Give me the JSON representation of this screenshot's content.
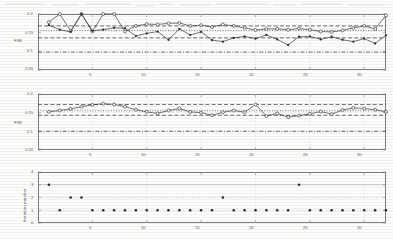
{
  "figure": {
    "title": "",
    "background": "#fdfdfc",
    "ink_color": "#4a4a4a"
  },
  "panels": [
    {
      "name": "panel-1",
      "ylabel": "F/M",
      "yticks": [
        "0.2",
        "0.15",
        "0.1",
        "0.05"
      ],
      "ytick_values": [
        0.2,
        0.15,
        0.1,
        0.05
      ],
      "xticks": [
        "5",
        "10",
        "15",
        "20",
        "25",
        "30"
      ],
      "xtick_values": [
        5,
        10,
        15,
        20,
        25,
        30
      ]
    },
    {
      "name": "panel-2",
      "ylabel": "F/M",
      "yticks": [
        "0.2",
        "0.15",
        "0.1",
        "0.05"
      ],
      "ytick_values": [
        0.2,
        0.15,
        0.1,
        0.05
      ],
      "xticks": [
        "5",
        "10",
        "15",
        "20",
        "25",
        "30"
      ],
      "xtick_values": [
        5,
        10,
        15,
        20,
        25,
        30
      ]
    },
    {
      "name": "panel-3",
      "ylabel": "Iteration number",
      "yticks": [
        "0",
        "1",
        "2",
        "3",
        "4"
      ],
      "ytick_values": [
        0,
        1,
        2,
        3,
        4
      ],
      "xticks": [
        "5",
        "10",
        "15",
        "20",
        "25",
        "30"
      ],
      "xtick_values": [
        5,
        10,
        15,
        20,
        25,
        30
      ]
    }
  ],
  "chart_data": [
    {
      "type": "line",
      "title": "",
      "xlabel": "",
      "ylabel": "F/M",
      "xlim": [
        0,
        32
      ],
      "ylim": [
        0.05,
        0.2
      ],
      "grid": false,
      "legend": "none",
      "x": [
        1,
        2,
        3,
        4,
        5,
        6,
        7,
        8,
        9,
        10,
        11,
        12,
        13,
        14,
        15,
        16,
        17,
        18,
        19,
        20,
        21,
        22,
        23,
        24,
        25,
        26,
        27,
        28,
        29,
        30,
        31,
        32
      ],
      "series": [
        {
          "name": "series-a",
          "marker": "circle-open",
          "values": [
            0.178,
            0.2,
            0.155,
            0.2,
            0.153,
            0.2,
            0.2,
            0.153,
            0.168,
            0.173,
            0.172,
            0.175,
            0.176,
            0.168,
            0.17,
            0.165,
            0.172,
            0.168,
            0.163,
            0.157,
            0.16,
            0.16,
            0.158,
            0.161,
            0.158,
            0.153,
            0.152,
            0.156,
            0.163,
            0.168,
            0.16,
            0.196
          ]
        },
        {
          "name": "series-b",
          "marker": "dot-filled",
          "values": [
            0.17,
            0.158,
            0.152,
            0.2,
            0.155,
            0.158,
            0.163,
            0.162,
            0.141,
            0.148,
            0.153,
            0.131,
            0.16,
            0.144,
            0.152,
            0.13,
            0.126,
            0.136,
            0.14,
            0.134,
            0.144,
            0.132,
            0.117,
            0.139,
            0.14,
            0.132,
            0.139,
            0.131,
            0.126,
            0.134,
            0.121,
            0.143
          ]
        }
      ],
      "reference_lines": [
        {
          "name": "upper-dashed",
          "y": 0.168,
          "style": "dashed"
        },
        {
          "name": "mid-dotted",
          "y": 0.156,
          "style": "dotted"
        },
        {
          "name": "lower-dashed",
          "y": 0.136,
          "style": "dashed"
        },
        {
          "name": "base-dashdot",
          "y": 0.098,
          "style": "dashdot"
        }
      ]
    },
    {
      "type": "line",
      "title": "",
      "xlabel": "",
      "ylabel": "F/M",
      "xlim": [
        0,
        32
      ],
      "ylim": [
        0.05,
        0.2
      ],
      "grid": false,
      "legend": "none",
      "x": [
        1,
        2,
        3,
        4,
        5,
        6,
        7,
        8,
        9,
        10,
        11,
        12,
        13,
        14,
        15,
        16,
        17,
        18,
        19,
        20,
        21,
        22,
        23,
        24,
        25,
        26,
        27,
        28,
        29,
        30,
        31,
        32
      ],
      "series": [
        {
          "name": "series-a",
          "marker": "circle-open",
          "values": [
            0.152,
            0.156,
            0.16,
            0.166,
            0.171,
            0.174,
            0.172,
            0.166,
            0.158,
            0.152,
            0.148,
            0.156,
            0.161,
            0.152,
            0.15,
            0.143,
            0.151,
            0.156,
            0.151,
            0.172,
            0.141,
            0.148,
            0.138,
            0.142,
            0.147,
            0.153,
            0.146,
            0.157,
            0.163,
            0.161,
            0.158,
            0.152
          ]
        }
      ],
      "reference_lines": [
        {
          "name": "upper-dashed",
          "y": 0.172,
          "style": "dashed"
        },
        {
          "name": "mid-dotted",
          "y": 0.155,
          "style": "dotted"
        },
        {
          "name": "lower-dashed",
          "y": 0.143,
          "style": "dashed"
        },
        {
          "name": "base-dashdot",
          "y": 0.1,
          "style": "dashdot"
        }
      ]
    },
    {
      "type": "scatter",
      "title": "",
      "xlabel": "",
      "ylabel": "Iteration number",
      "xlim": [
        0,
        32
      ],
      "ylim": [
        0,
        4
      ],
      "grid": false,
      "legend": "none",
      "x": [
        1,
        2,
        3,
        4,
        5,
        6,
        7,
        8,
        9,
        10,
        11,
        12,
        13,
        14,
        15,
        16,
        17,
        18,
        19,
        20,
        21,
        22,
        23,
        24,
        25,
        26,
        27,
        28,
        29,
        30,
        31,
        32
      ],
      "values": [
        3,
        1,
        2,
        2,
        1,
        1,
        1,
        1,
        1,
        1,
        1,
        1,
        1,
        1,
        1,
        1,
        2,
        1,
        1,
        1,
        1,
        1,
        1,
        3,
        1,
        1,
        1,
        1,
        1,
        1,
        1,
        1
      ]
    }
  ]
}
